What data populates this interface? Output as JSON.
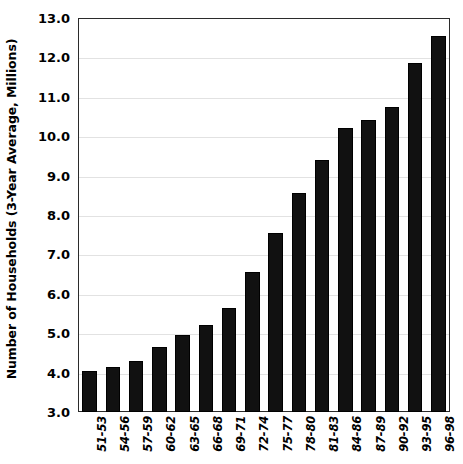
{
  "chart_data": {
    "type": "bar",
    "title": "",
    "xlabel": "",
    "ylabel": "Number of Households (3-Year Average, Millions)",
    "categories": [
      "51-53",
      "54-56",
      "57-59",
      "60-62",
      "63-65",
      "66-68",
      "69-71",
      "72-74",
      "75-77",
      "78-80",
      "81-83",
      "84-86",
      "87-89",
      "90-92",
      "93-95",
      "96-98"
    ],
    "values": [
      4.05,
      4.15,
      4.3,
      4.65,
      4.95,
      5.2,
      5.65,
      6.55,
      7.55,
      8.55,
      9.4,
      10.2,
      10.4,
      10.75,
      11.85,
      12.55
    ],
    "ylim": [
      3.0,
      13.0
    ],
    "ytick_labels": [
      "13.0",
      "12.0",
      "11.0",
      "10.0",
      "9.0",
      "8.0",
      "7.0",
      "6.0",
      "5.0",
      "4.0",
      "3.0"
    ],
    "ytick_values": [
      13.0,
      12.0,
      11.0,
      10.0,
      9.0,
      8.0,
      7.0,
      6.0,
      5.0,
      4.0,
      3.0
    ],
    "grid": true,
    "legend": "none",
    "bar_color": "#111111",
    "grid_color": "#e2e2e2",
    "axis_color": "#2b2b2b"
  }
}
